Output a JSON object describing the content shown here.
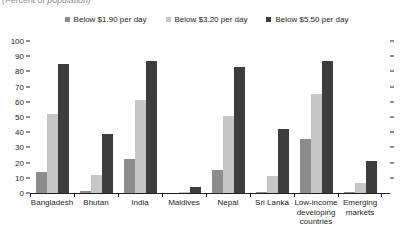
{
  "subtitle": "(Percent of population)",
  "colors": {
    "series_1": "#8c8c8c",
    "series_2": "#c6c6c6",
    "series_3": "#3d3d3d",
    "axis": "#231f20"
  },
  "legend": [
    {
      "label": "Below $1.90 per day",
      "color": "#8c8c8c"
    },
    {
      "label": "Below $3.20 per day",
      "color": "#c6c6c6"
    },
    {
      "label": "Below $5.50 per day",
      "color": "#3d3d3d"
    }
  ],
  "yticks": [
    "100",
    "90",
    "80",
    "70",
    "60",
    "50",
    "40",
    "30",
    "20",
    "10",
    "0"
  ],
  "chart_data": {
    "type": "bar",
    "title": "",
    "subtitle": "(Percent of population)",
    "xlabel": "",
    "ylabel": "",
    "ylim": [
      0,
      100
    ],
    "ytick_step": 10,
    "grid": false,
    "legend_position": "top-center",
    "categories": [
      "Bangladesh",
      "Bhutan",
      "India",
      "Maldives",
      "Nepal",
      "Sri Lanka",
      "Low-income developing countries",
      "Emerging markets"
    ],
    "series": [
      {
        "name": "Below $1.90 per day",
        "color": "#8c8c8c",
        "values": [
          14.0,
          1.0,
          22.5,
          0.2,
          15.0,
          0.5,
          35.5,
          0.8
        ]
      },
      {
        "name": "Below $3.20 per day",
        "color": "#c6c6c6",
        "values": [
          52.0,
          12.0,
          61.5,
          0.6,
          50.5,
          11.0,
          65.0,
          6.5
        ]
      },
      {
        "name": "Below $5.50 per day",
        "color": "#3d3d3d",
        "values": [
          85.0,
          39.0,
          87.0,
          4.0,
          83.0,
          42.0,
          87.0,
          21.0
        ]
      }
    ]
  }
}
